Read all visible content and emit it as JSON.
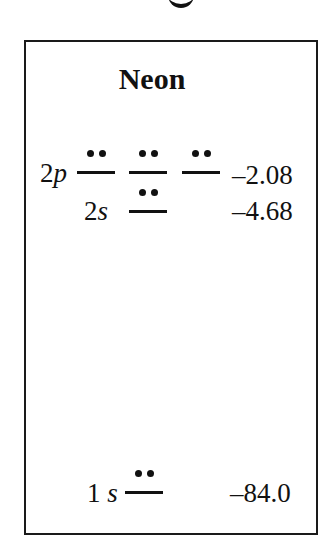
{
  "diagram": {
    "title": "Neon",
    "levels": [
      {
        "label_num": "2",
        "label_orb": "p",
        "orbitals": 3,
        "electrons_per_orbital": 2,
        "energy": "–2.08"
      },
      {
        "label_num": "2",
        "label_orb": "s",
        "orbitals": 1,
        "electrons_per_orbital": 2,
        "energy": "–4.68"
      },
      {
        "label_num": "1",
        "label_orb": "s",
        "orbitals": 1,
        "electrons_per_orbital": 2,
        "energy": "–84.0"
      }
    ]
  }
}
